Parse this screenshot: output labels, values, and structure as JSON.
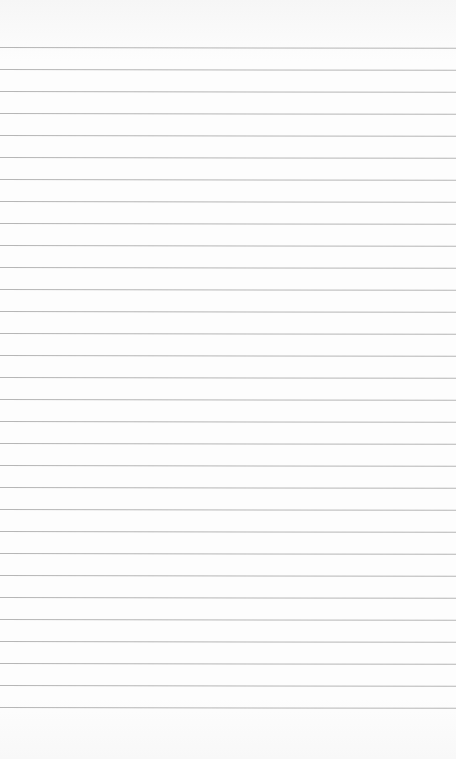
{
  "page": {
    "type": "blank lined paper",
    "background_color": "#fdfdfd",
    "rule_color": "#a9a9a9",
    "rule_count": 31,
    "first_rule_y": 47,
    "rule_spacing_px": 22,
    "text": ""
  }
}
